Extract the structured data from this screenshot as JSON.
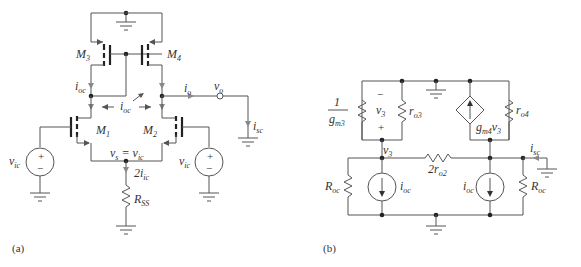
{
  "figure_a": {
    "caption": "(a)",
    "transistors": [
      {
        "name": "M",
        "sub": "3"
      },
      {
        "name": "M",
        "sub": "4"
      },
      {
        "name": "M",
        "sub": "1"
      },
      {
        "name": "M",
        "sub": "2"
      }
    ],
    "labels": {
      "i_oc_left": {
        "base": "i",
        "sub": "oc"
      },
      "i_oc_mid": {
        "base": "i",
        "sub": "oc"
      },
      "i_o": {
        "base": "i",
        "sub": "o"
      },
      "v_o": {
        "base": "v",
        "sub": "o"
      },
      "i_sc": {
        "base": "i",
        "sub": "sc"
      },
      "v_s": {
        "text": "v",
        "sub": "s",
        "eq": " = v",
        "eq_sub": "ic"
      },
      "two_i_ic": {
        "base": "2i",
        "sub": "ic"
      },
      "r_ss": {
        "base": "R",
        "sub": "SS"
      },
      "v_ic_left": {
        "base": "v",
        "sub": "ic"
      },
      "v_ic_right": {
        "base": "v",
        "sub": "ic"
      },
      "plus": "+",
      "minus": "−"
    }
  },
  "figure_b": {
    "caption": "(b)",
    "labels": {
      "one": "1",
      "gm3": {
        "base": "g",
        "sub": "m3"
      },
      "ro3": {
        "base": "r",
        "sub": "o3"
      },
      "ro4": {
        "base": "r",
        "sub": "o4"
      },
      "v3_inner": {
        "base": "v",
        "sub": "3"
      },
      "v3_node": {
        "base": "v",
        "sub": "3"
      },
      "gm4v3": {
        "base": "g",
        "sub": "m4",
        "tail": "v",
        "tail_sub": "3"
      },
      "two_ro2": {
        "base": "2r",
        "sub": "o2"
      },
      "r_oc_left": {
        "base": "R",
        "sub": "oc"
      },
      "r_oc_right": {
        "base": "R",
        "sub": "oc"
      },
      "i_oc_left": {
        "base": "i",
        "sub": "oc"
      },
      "i_oc_right": {
        "base": "i",
        "sub": "oc"
      },
      "i_sc": {
        "base": "i",
        "sub": "sc"
      },
      "plus": "+",
      "minus": "−"
    }
  }
}
